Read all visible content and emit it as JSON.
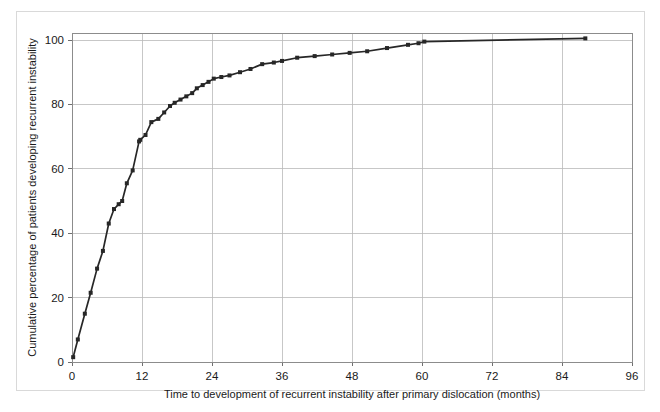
{
  "figure": {
    "background_color": "#ffffff",
    "frame_color": "#d9d9d9",
    "plot_border_color": "#8c8c8c"
  },
  "chart_data": {
    "type": "line",
    "title": "",
    "subtitle": "",
    "xlabel": "Time to development of recurrent instability after primary dislocation (months)",
    "ylabel": "Cumulative percentage of patients developing recurrent instability",
    "xlim": [
      0,
      96
    ],
    "ylim": [
      0,
      106
    ],
    "xticks": [
      0,
      12,
      24,
      36,
      48,
      60,
      72,
      84,
      96
    ],
    "xticklabels": [
      "0",
      "12",
      "24",
      "36",
      "48",
      "60",
      "72",
      "84",
      "96"
    ],
    "yticks": [
      0,
      20,
      40,
      60,
      80,
      100
    ],
    "yticklabels": [
      "0",
      "20",
      "40",
      "60",
      "80",
      "100"
    ],
    "grid": true,
    "grid_color": "#b9b9b9",
    "legend": false,
    "legend_position": "none",
    "marker": "square",
    "marker_size": 4,
    "line_color": "#272727",
    "marker_color": "#272727",
    "series": [
      {
        "name": "Cumulative recurrence",
        "x": [
          0.2,
          1.0,
          2.2,
          3.2,
          4.3,
          5.3,
          6.3,
          7.2,
          8.0,
          8.6,
          9.4,
          10.4,
          11.5,
          11.7,
          12.6,
          13.6,
          14.8,
          15.8,
          16.8,
          17.6,
          18.6,
          19.6,
          20.6,
          21.4,
          22.4,
          23.4,
          24.3,
          25.6,
          27.0,
          28.8,
          30.6,
          32.6,
          34.6,
          36.0,
          38.6,
          41.6,
          44.6,
          47.6,
          50.6,
          54.0,
          57.6,
          59.4,
          60.4,
          88.0
        ],
        "y": [
          1.5,
          7.0,
          15.0,
          21.5,
          29.0,
          34.5,
          43.0,
          47.5,
          49.0,
          50.0,
          55.5,
          59.5,
          68.5,
          69.0,
          70.5,
          74.5,
          75.5,
          77.5,
          79.5,
          80.5,
          81.5,
          82.5,
          83.5,
          85.0,
          86.0,
          87.0,
          88.0,
          88.5,
          89.0,
          90.0,
          91.0,
          92.5,
          93.0,
          93.5,
          94.5,
          95.0,
          95.5,
          96.0,
          96.5,
          97.5,
          98.5,
          99.0,
          99.5,
          100.5
        ]
      }
    ]
  }
}
